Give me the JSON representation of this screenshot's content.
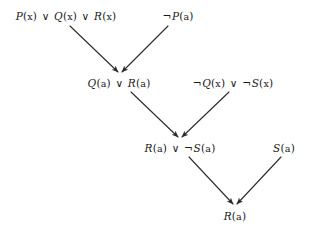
{
  "diagram": {
    "stroke_color": "#2b2b2b",
    "text_color": "#1a1a1a",
    "background": "#ffffff",
    "nodes": [
      {
        "id": "c1",
        "label": "P(x) ∨ Q(x) ∨ R(x)",
        "x": 66,
        "y": 16,
        "level": 0
      },
      {
        "id": "c2",
        "label": "¬P(a)",
        "x": 178,
        "y": 16,
        "level": 0
      },
      {
        "id": "c3",
        "label": "Q(a) ∨ R(a)",
        "x": 119,
        "y": 83,
        "level": 1
      },
      {
        "id": "c4",
        "label": "¬Q(x) ∨ ¬S(x)",
        "x": 233,
        "y": 83,
        "level": 1
      },
      {
        "id": "c5",
        "label": "R(a) ∨ ¬S(a)",
        "x": 180,
        "y": 148,
        "level": 2
      },
      {
        "id": "c6",
        "label": "S(a)",
        "x": 284,
        "y": 148,
        "level": 2
      },
      {
        "id": "c7",
        "label": "R(a)",
        "x": 235,
        "y": 216,
        "level": 3
      }
    ],
    "edges": [
      {
        "from": "c1",
        "to": "c3",
        "x1": 70,
        "y1": 26,
        "x2": 118,
        "y2": 72,
        "arrow": true
      },
      {
        "from": "c2",
        "to": "c3",
        "x1": 168,
        "y1": 26,
        "x2": 122,
        "y2": 72,
        "arrow": true
      },
      {
        "from": "c3",
        "to": "c5",
        "x1": 131,
        "y1": 92,
        "x2": 178,
        "y2": 137,
        "arrow": true
      },
      {
        "from": "c4",
        "to": "c5",
        "x1": 229,
        "y1": 92,
        "x2": 182,
        "y2": 137,
        "arrow": true
      },
      {
        "from": "c5",
        "to": "c7",
        "x1": 189,
        "y1": 157,
        "x2": 233,
        "y2": 204,
        "arrow": true
      },
      {
        "from": "c6",
        "to": "c7",
        "x1": 281,
        "y1": 157,
        "x2": 237,
        "y2": 204,
        "arrow": true
      }
    ]
  }
}
